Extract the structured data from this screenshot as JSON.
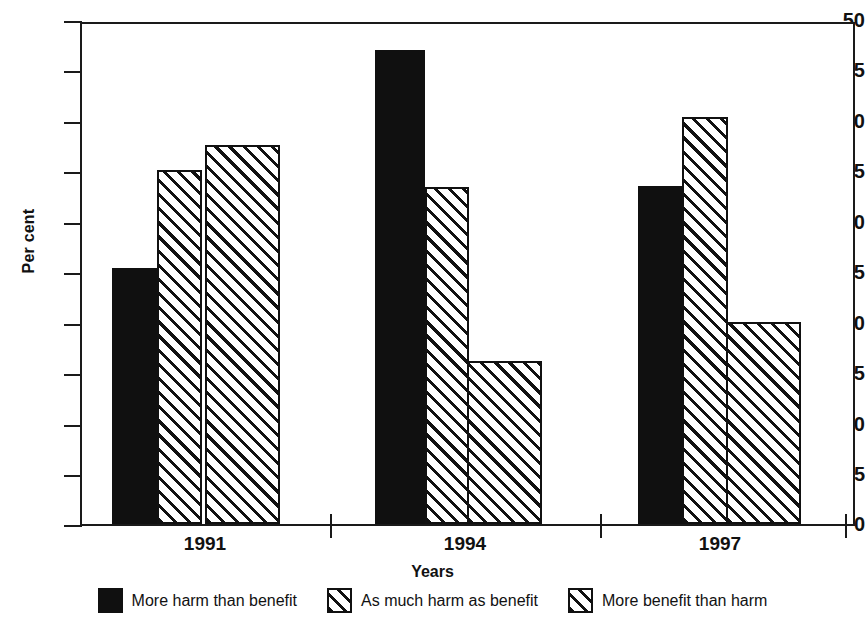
{
  "chart_data": {
    "type": "bar",
    "title": "",
    "xlabel": "Years",
    "ylabel": "Per cent",
    "categories": [
      "1991",
      "1994",
      "1997"
    ],
    "ylim": [
      0,
      50
    ],
    "yticks": [
      0,
      5,
      10,
      15,
      20,
      25,
      30,
      35,
      40,
      45,
      50
    ],
    "ytick_labels": [
      "0",
      "5",
      "10",
      "15",
      "20",
      "25",
      "30",
      "35",
      "40",
      "45",
      "50"
    ],
    "grid": false,
    "legend_position": "bottom",
    "series": [
      {
        "name": "More harm than benefit",
        "fill": "solid-black",
        "values": [
          25.6,
          47.4,
          33.8
        ]
      },
      {
        "name": "As much harm as benefit",
        "fill": "diagonal-hatch",
        "values": [
          35.4,
          33.7,
          40.7
        ]
      },
      {
        "name": "More benefit than harm",
        "fill": "diagonal-hatch",
        "values": [
          37.9,
          16.3,
          20.2
        ]
      }
    ]
  },
  "axes": {
    "y_title": "Per cent",
    "x_title": "Years",
    "y_labels": [
      "50",
      "45",
      "40",
      "35",
      "30",
      "25",
      "20",
      "15",
      "10",
      "5",
      "0"
    ],
    "x_labels": [
      "1991",
      "1994",
      "1997"
    ]
  },
  "legend": {
    "items": [
      {
        "label": "More harm than benefit",
        "swatch": "solid-black-swatch"
      },
      {
        "label": "As much harm as benefit",
        "swatch": "hatched-swatch"
      },
      {
        "label": "More benefit than harm",
        "swatch": "hatched-swatch"
      }
    ]
  }
}
